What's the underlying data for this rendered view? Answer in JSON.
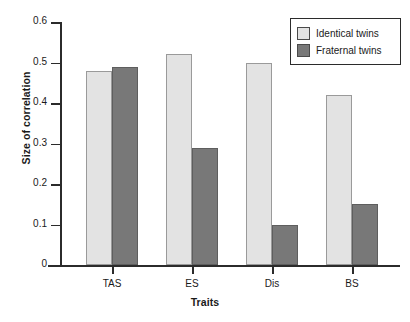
{
  "chart_data": {
    "type": "bar",
    "title": "",
    "xlabel": "Traits",
    "ylabel": "Size of correlation",
    "categories": [
      "TAS",
      "ES",
      "Dis",
      "BS"
    ],
    "series": [
      {
        "name": "Identical twins",
        "values": [
          0.48,
          0.52,
          0.5,
          0.42
        ],
        "color": "#e3e3e3"
      },
      {
        "name": "Fraternal twins",
        "values": [
          0.49,
          0.29,
          0.1,
          0.15
        ],
        "color": "#787878"
      }
    ],
    "ylim": [
      0,
      0.6
    ],
    "ytick_labels": [
      "0",
      "0.1",
      "0.2",
      "0.3",
      "0.4",
      "0.5",
      "0.6"
    ],
    "ytick_values": [
      0,
      0.1,
      0.2,
      0.3,
      0.4,
      0.5,
      0.6
    ],
    "grid": false,
    "legend_position": "top-right"
  }
}
